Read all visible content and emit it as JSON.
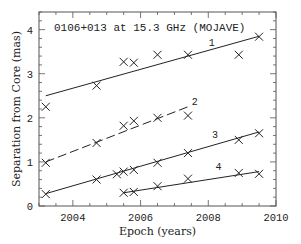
{
  "chart_data": {
    "type": "scatter",
    "title": "0106+013 at 15.3 GHz (MOJAVE)",
    "xlabel": "Epoch (years)",
    "ylabel": "Separation from Core (mas)",
    "xlim": [
      2003.0,
      2010.0
    ],
    "ylim": [
      0,
      4.4
    ],
    "xticks_major": [
      2004,
      2006,
      2008,
      2010
    ],
    "xticks_minor_step": 0.5,
    "yticks_major": [
      0,
      1,
      2,
      3,
      4
    ],
    "yticks_minor_step": 0.2,
    "grid": false,
    "legend": "none (inline component labels 1-4)",
    "series": [
      {
        "name": "1",
        "marker": "x",
        "line_style": "solid",
        "label_pos": [
          2008.1,
          3.62
        ],
        "points": [
          [
            2003.2,
            2.25
          ],
          [
            2004.7,
            2.73
          ],
          [
            2005.5,
            3.27
          ],
          [
            2005.8,
            3.25
          ],
          [
            2006.5,
            3.43
          ],
          [
            2007.4,
            3.43
          ],
          [
            2008.9,
            3.43
          ],
          [
            2009.5,
            3.84
          ]
        ],
        "fit": [
          [
            2003.2,
            2.5
          ],
          [
            2009.5,
            3.85
          ]
        ]
      },
      {
        "name": "2",
        "marker": "x",
        "line_style": "dashed",
        "label_pos": [
          2007.6,
          2.3
        ],
        "points": [
          [
            2003.2,
            0.98
          ],
          [
            2004.7,
            1.43
          ],
          [
            2005.5,
            1.82
          ],
          [
            2005.8,
            1.93
          ],
          [
            2006.5,
            2.0
          ],
          [
            2007.4,
            2.05
          ]
        ],
        "fit": [
          [
            2003.2,
            1.0
          ],
          [
            2007.4,
            2.25
          ]
        ]
      },
      {
        "name": "3",
        "marker": "x",
        "line_style": "solid",
        "label_pos": [
          2008.2,
          1.55
        ],
        "points": [
          [
            2003.2,
            0.27
          ],
          [
            2004.7,
            0.6
          ],
          [
            2005.3,
            0.72
          ],
          [
            2005.5,
            0.78
          ],
          [
            2005.8,
            0.82
          ],
          [
            2006.5,
            0.98
          ],
          [
            2007.4,
            1.2
          ],
          [
            2008.9,
            1.5
          ],
          [
            2009.5,
            1.65
          ]
        ],
        "fit": [
          [
            2003.2,
            0.28
          ],
          [
            2009.5,
            1.68
          ]
        ]
      },
      {
        "name": "4",
        "marker": "x",
        "line_style": "solid",
        "label_pos": [
          2008.3,
          0.82
        ],
        "points": [
          [
            2005.5,
            0.3
          ],
          [
            2005.8,
            0.32
          ],
          [
            2006.5,
            0.45
          ],
          [
            2007.4,
            0.62
          ],
          [
            2008.9,
            0.75
          ],
          [
            2009.5,
            0.73
          ]
        ],
        "fit": [
          [
            2005.5,
            0.3
          ],
          [
            2009.5,
            0.78
          ]
        ]
      }
    ]
  },
  "colors": {
    "axis": "#555555",
    "data": "#222222",
    "background": "#ffffff"
  }
}
